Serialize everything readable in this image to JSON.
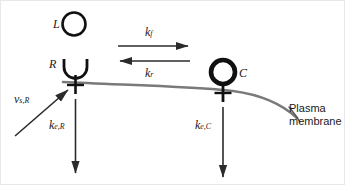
{
  "figure": {
    "colors": {
      "ink": "#1a1a1a",
      "membrane": "#7a7a7a",
      "arrow": "#2b2b2b",
      "background": "#ffffff",
      "border": "#e8e8e8"
    }
  },
  "species": {
    "ligand": {
      "symbol": "L",
      "name": "ligand"
    },
    "receptor": {
      "symbol": "R",
      "name": "free-receptor"
    },
    "complex": {
      "symbol": "C",
      "name": "ligand-receptor-complex"
    }
  },
  "rates": {
    "forward": {
      "base": "k",
      "sub": "f",
      "name": "association-rate"
    },
    "reverse": {
      "base": "k",
      "sub": "r",
      "name": "dissociation-rate"
    },
    "synthesis": {
      "base": "v",
      "sub": "s,R",
      "name": "receptor-synthesis-rate"
    },
    "elim_receptor": {
      "base": "k",
      "sub": "e,R",
      "name": "receptor-elimination-rate"
    },
    "elim_complex": {
      "base": "k",
      "sub": "e,C",
      "name": "complex-elimination-rate"
    }
  },
  "annotations": {
    "membrane_line1": "Plasma",
    "membrane_line2": "membrane"
  }
}
